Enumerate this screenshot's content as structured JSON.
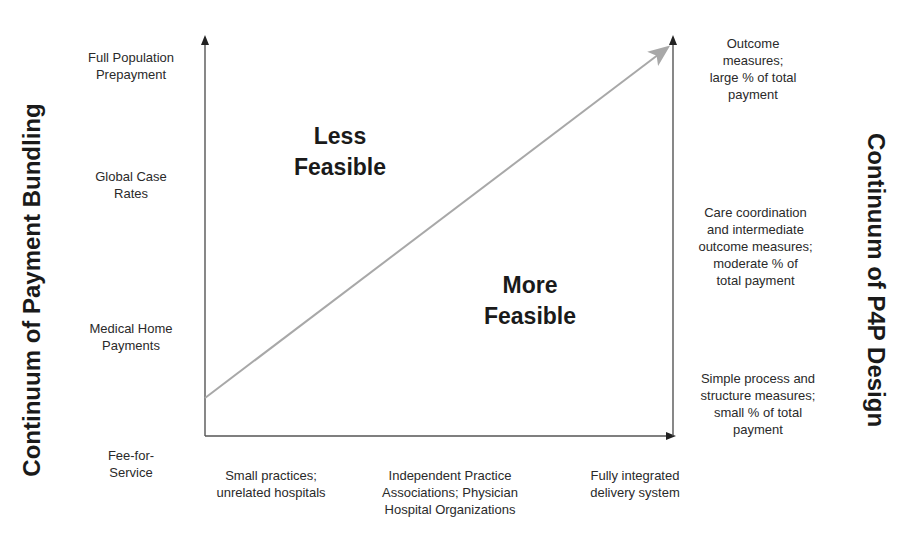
{
  "diagram": {
    "left_axis_title": "Continuum of Payment Bundling",
    "right_axis_title": "Continuum of P4P Design",
    "left_axis_levels": [
      {
        "label": "Full Population\nPrepayment"
      },
      {
        "label": "Global Case\nRates"
      },
      {
        "label": "Medical Home\nPayments"
      },
      {
        "label": "Fee-for-\nService"
      }
    ],
    "bottom_axis_levels": [
      {
        "label": "Small practices;\nunrelated hospitals"
      },
      {
        "label": "Independent Practice\nAssociations; Physician\nHospital Organizations"
      },
      {
        "label": "Fully integrated\ndelivery system"
      }
    ],
    "right_axis_levels": [
      {
        "label": "Outcome\nmeasures;\nlarge % of total\npayment"
      },
      {
        "label": "Care coordination\nand intermediate\noutcome measures;\nmoderate % of\ntotal payment"
      },
      {
        "label": "Simple process and\nstructure measures;\nsmall % of total\npayment"
      }
    ],
    "regions": {
      "upper_left": "Less\nFeasible",
      "lower_right": "More\nFeasible"
    },
    "colors": {
      "axis": "#555555",
      "diagonal_arrow": "#a8a8a8",
      "text": "#222222"
    }
  }
}
